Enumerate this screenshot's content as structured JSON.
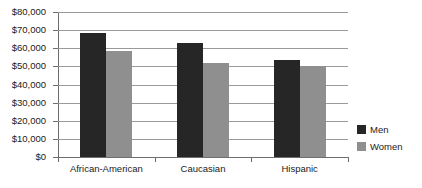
{
  "chart_data": {
    "type": "bar",
    "title": "",
    "subtitle": "",
    "xlabel": "",
    "ylabel": "",
    "categories": [
      "African-American",
      "Caucasian",
      "Hispanic"
    ],
    "series": [
      {
        "name": "Men",
        "color": "#262626",
        "values": [
          68500,
          63000,
          53500
        ]
      },
      {
        "name": "Women",
        "color": "#8f8f8f",
        "values": [
          58500,
          52000,
          50000
        ]
      }
    ],
    "ylim": [
      0,
      80000
    ],
    "ytick_values": [
      0,
      10000,
      20000,
      30000,
      40000,
      50000,
      60000,
      70000,
      80000
    ],
    "ytick_labels": [
      "$0",
      "$10,000",
      "$20,000",
      "$30,000",
      "$40,000",
      "$50,000",
      "$60,000",
      "$70,000",
      "$80,000"
    ],
    "grid": true,
    "grid_axis": "y",
    "legend_position": "right-bottom",
    "legend_entries": [
      "Men",
      "Women"
    ],
    "annotations": [],
    "background_color": "#ffffff",
    "gridline_color": "#9a9a9a",
    "axis_color": "#6e6e6e"
  }
}
